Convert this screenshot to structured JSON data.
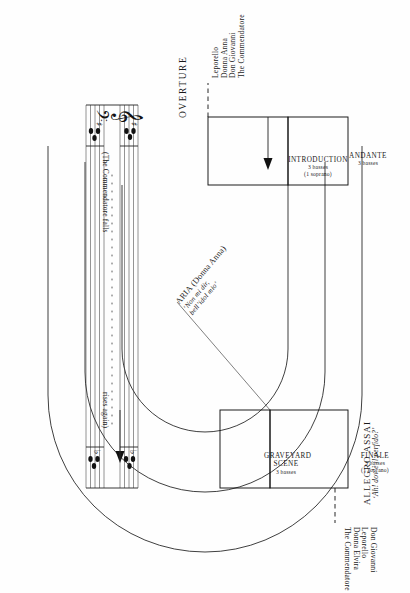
{
  "figure": {
    "title_overture": "OVERTURE",
    "tempo_left": {
      "main": "",
      "quote": ""
    },
    "tempo_right": {
      "main": "ALLEGRO ASSAI",
      "quote": "‘Ah! dov’è il perfido?’"
    },
    "boxes": [
      {
        "id": "introduction",
        "title": "INTRODUCTION",
        "sub1": "3 basses",
        "sub2": "(1 soprano)"
      },
      {
        "id": "andante",
        "title": "ANDANTE",
        "sub1": "3 basses",
        "sub2": ""
      },
      {
        "id": "graveyard-scene",
        "title": "GRAVEYARD SCENE",
        "sub1": "3 basses",
        "sub2": ""
      },
      {
        "id": "finale",
        "title": "FINALE",
        "sub1": "3 basses",
        "sub2": "(1 soprano)"
      }
    ],
    "aria": {
      "name": "ARIA (Donna Anna)",
      "quote_line1": "‘Non mi dir,",
      "quote_line2": "bell’idol mio’"
    },
    "cast_left": [
      "Leporello",
      "Donna Anna",
      "Don Giovanni",
      "The Commendatore"
    ],
    "cast_right": [
      "Don Giovanni",
      "Leporello",
      "Donna Elvira",
      "The Commendatore"
    ],
    "stage_directions": {
      "falls": "(The Commendatore falls",
      "rises": "rises again)"
    },
    "colors": {
      "ink": "#1a1a1a",
      "paper": "#fefefe",
      "rule": "#3a3a3a"
    }
  }
}
